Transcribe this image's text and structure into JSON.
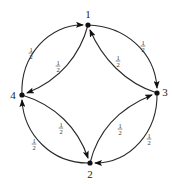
{
  "diagram": {
    "type": "markov-chain",
    "nodes": [
      {
        "id": "1",
        "label": "1",
        "x": 88,
        "y": 25,
        "lx": 88,
        "ly": 17
      },
      {
        "id": "2",
        "label": "2",
        "x": 90,
        "y": 163,
        "lx": 90,
        "ly": 178
      },
      {
        "id": "3",
        "label": "3",
        "x": 157,
        "y": 93,
        "lx": 165,
        "ly": 96
      },
      {
        "id": "4",
        "label": "4",
        "x": 22,
        "y": 95,
        "lx": 13,
        "ly": 99
      }
    ],
    "edges": [
      {
        "from": "4",
        "to": "1",
        "kind": "outer",
        "weight_num": "1",
        "weight_den": "2",
        "label": "1/2"
      },
      {
        "from": "1",
        "to": "3",
        "kind": "outer",
        "weight_num": "1",
        "weight_den": "2",
        "label": "1/2"
      },
      {
        "from": "3",
        "to": "2",
        "kind": "outer",
        "weight_num": "1",
        "weight_den": "2",
        "label": "1/2"
      },
      {
        "from": "2",
        "to": "4",
        "kind": "outer",
        "weight_num": "1",
        "weight_den": "2",
        "label": "1/2"
      },
      {
        "from": "1",
        "to": "4",
        "kind": "inner",
        "weight_num": "1",
        "weight_den": "2",
        "label": "1/2"
      },
      {
        "from": "3",
        "to": "1",
        "kind": "inner",
        "weight_num": "1",
        "weight_den": "2",
        "label": "1/2"
      },
      {
        "from": "2",
        "to": "3",
        "kind": "inner",
        "weight_num": "1",
        "weight_den": "2",
        "label": "1/2"
      },
      {
        "from": "4",
        "to": "2",
        "kind": "inner",
        "weight_num": "1",
        "weight_den": "2",
        "label": "1/2"
      }
    ]
  }
}
